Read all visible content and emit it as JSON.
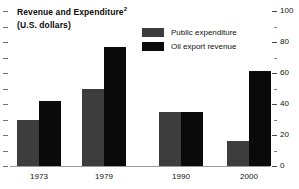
{
  "chart_data": {
    "type": "bar",
    "title": "Revenue and Expenditure",
    "title_superscript": "2",
    "subtitle": "(U.S. dollars)",
    "xlabel": "",
    "ylabel": "",
    "ylim": [
      0,
      100
    ],
    "y_axis_position": "right",
    "y_major_ticks": [
      0,
      20,
      40,
      60,
      80,
      100
    ],
    "y_minor_ticks": [
      10,
      30,
      50,
      70,
      90
    ],
    "grid": false,
    "legend_position": "top-center",
    "categories": [
      "1973",
      "1979",
      "1990",
      "2000"
    ],
    "series": [
      {
        "name": "Public expenditure",
        "color": "#3d3d3d",
        "values": [
          30,
          50,
          35,
          16
        ]
      },
      {
        "name": "Oil export revenue",
        "color": "#0a0a0a",
        "values": [
          42,
          77,
          35,
          61
        ]
      }
    ]
  },
  "axis": {
    "tick_labels": [
      "100",
      "80",
      "60",
      "40",
      "20",
      "0"
    ]
  }
}
